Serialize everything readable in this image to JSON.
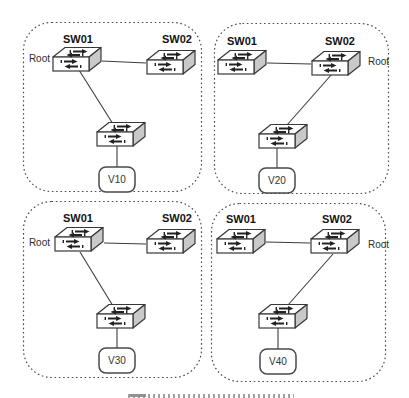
{
  "diagram": {
    "type": "spanning-tree-vlan-topology",
    "panels": [
      {
        "position": "top-left",
        "switch1_label": "SW01",
        "switch2_label": "SW02",
        "root_label": "Root",
        "root_switch": "SW01",
        "vlan_label": "V10"
      },
      {
        "position": "top-right",
        "switch1_label": "SW01",
        "switch2_label": "SW02",
        "root_label": "Root",
        "root_switch": "SW02",
        "vlan_label": "V20"
      },
      {
        "position": "bottom-left",
        "switch1_label": "SW01",
        "switch2_label": "SW02",
        "root_label": "Root",
        "root_switch": "SW01",
        "vlan_label": "V30"
      },
      {
        "position": "bottom-right",
        "switch1_label": "SW01",
        "switch2_label": "SW02",
        "root_label": "Root",
        "root_switch": "SW02",
        "vlan_label": "V40"
      }
    ]
  },
  "colors": {
    "line": "#3d3d3d",
    "switch_side_shade": "#c9c9c9",
    "panel_border": "#4d4d4d",
    "background": "#ffffff"
  }
}
